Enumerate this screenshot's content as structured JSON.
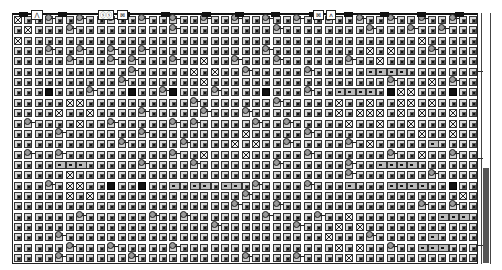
{
  "board": {
    "cols": 45,
    "rows": 24,
    "origin_x": 1,
    "origin_y": 1,
    "pitch_x": 10.35,
    "pitch_y": 10.35,
    "legend": {
      ".": "tile",
      "#": "wall-block",
      "X": "link-cluster",
      "=": "bar-segment",
      "a": "creature-sprite"
    },
    "grid": [
      "X..a..a..a..a..a..a..a..a..a..a..a..a..a..a..",
      ".X...a.........a.........a........a...a..a...",
      "X......................................X......",
      "...a..a..a..a...........a.........X.X...a....",
      ".....a...a.a...a..X..a...a......a..X.........",
      "...........a.....X.X..a.....a.....====.......",
      "..........a.......X.................a...X.a..#",
      "...#...a...#..a#...a....#...a..====.#XX...#...",
      ".....XX..........a.......a.....X..X..XX.X....",
      "....X..X....a.....a...a........X.XXX.X.X..X..",
      ".a....X..a.....a.a.....a..a.....X..X..X...X..",
      "....a.......a.........X.....a..........X..X..",
      "..........a.....a....X.X..a.....a.X.....=....",
      ".a..a..........a..X...X.....a.......a..X..a..",
      "....===.....a....a.......a......a..====......",
      ".....X..........................a.......a....",
      "...a.XX..#..#..=.==.==.a....a...=...====..#..",
      ".....X.X..............a....................X..",
      ".....................a...a.............a..a...",
      "......a......a..a.......a....a..X........===.",
      "...................a.......a...X.X............",
      "....a.........................X...a.....=....",
      ".....a...a.....a...............X.X..a..===...",
      "....a......a..........a....a....X............"
    ],
    "top_markers": [
      6,
      45,
      108,
      148,
      189,
      222,
      258,
      296,
      331,
      367,
      404,
      442
    ],
    "top_icons": [
      {
        "x": 18,
        "w": 10,
        "label": "⋀"
      },
      {
        "x": 85,
        "w": 14,
        "label": "ⓢⓢ"
      },
      {
        "x": 104,
        "w": 9,
        "label": "⊠"
      },
      {
        "x": 300,
        "w": 9,
        "label": "⊠"
      },
      {
        "x": 313,
        "w": 8,
        "label": "ʌ"
      }
    ]
  },
  "scrollbar": {
    "thumb_top": 155,
    "thumb_height": 95,
    "ticks": [
      58,
      145,
      232
    ]
  }
}
